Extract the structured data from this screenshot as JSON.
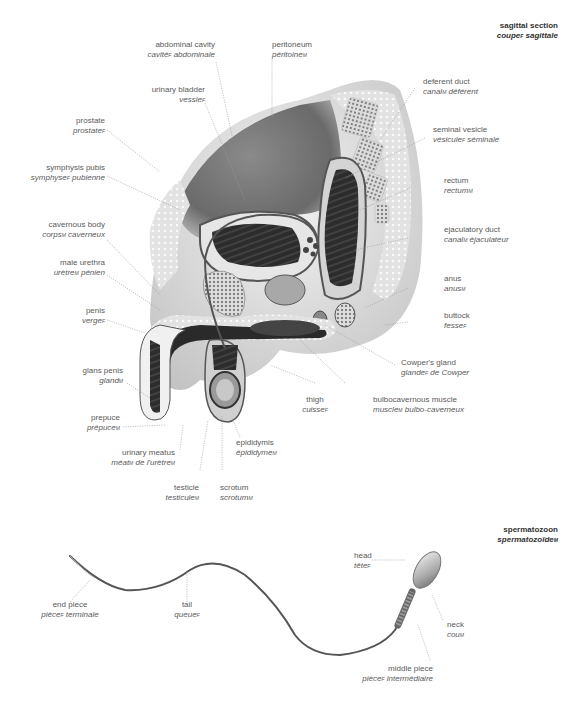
{
  "sections": {
    "sagittal": {
      "en": "sagittal section",
      "fr": "coupe",
      "fr_g": "F",
      "fr2": " sagittale"
    },
    "sperm": {
      "en": "spermatozoon",
      "fr": "spermatozoïde",
      "fr_g": "M",
      "fr2": ""
    }
  },
  "labels": {
    "abdominal_cavity": {
      "en": "abdominal cavity",
      "fr": "cavité",
      "g": "F",
      "fr2": " abdominale"
    },
    "peritoneum": {
      "en": "peritoneum",
      "fr": "péritoine",
      "g": "M",
      "fr2": ""
    },
    "urinary_bladder": {
      "en": "urinary bladder",
      "fr": "vessie",
      "g": "F",
      "fr2": ""
    },
    "prostate": {
      "en": "prostate",
      "fr": "prostate",
      "g": "F",
      "fr2": ""
    },
    "symphysis_pubis": {
      "en": "symphysis pubis",
      "fr": "symphyse",
      "g": "F",
      "fr2": " pubienne"
    },
    "cavernous_body": {
      "en": "cavernous body",
      "fr": "corps",
      "g": "M",
      "fr2": " caverneux"
    },
    "male_urethra": {
      "en": "male urethra",
      "fr": "urètre",
      "g": "M",
      "fr2": " pénien"
    },
    "penis": {
      "en": "penis",
      "fr": "verge",
      "g": "F",
      "fr2": ""
    },
    "glans_penis": {
      "en": "glans penis",
      "fr": "gland",
      "g": "M",
      "fr2": ""
    },
    "prepuce": {
      "en": "prepuce",
      "fr": "prépuce",
      "g": "M",
      "fr2": ""
    },
    "urinary_meatus": {
      "en": "urinary meatus",
      "fr": "méat",
      "g": "M",
      "fr2": " de l'urètre",
      "g2": "M"
    },
    "testicle": {
      "en": "testicle",
      "fr": "testicule",
      "g": "M",
      "fr2": ""
    },
    "scrotum": {
      "en": "scrotum",
      "fr": "scrotum",
      "g": "M",
      "fr2": ""
    },
    "epididymis": {
      "en": "epididymis",
      "fr": "épididyme",
      "g": "M",
      "fr2": ""
    },
    "thigh": {
      "en": "thigh",
      "fr": "cuisse",
      "g": "F",
      "fr2": ""
    },
    "bulbocavernous_muscle": {
      "en": "bulbocavernous muscle",
      "fr": "muscle",
      "g": "M",
      "fr2": " bulbo-caverneux"
    },
    "cowpers_gland": {
      "en": "Cowper's gland",
      "fr": "glande",
      "g": "F",
      "fr2": " de Cowper"
    },
    "buttock": {
      "en": "buttock",
      "fr": "fesse",
      "g": "F",
      "fr2": ""
    },
    "anus": {
      "en": "anus",
      "fr": "anus",
      "g": "M",
      "fr2": ""
    },
    "ejaculatory_duct": {
      "en": "ejaculatory duct",
      "fr": "canal",
      "g": "M",
      "fr2": " éjaculateur"
    },
    "rectum": {
      "en": "rectum",
      "fr": "rectum",
      "g": "M",
      "fr2": ""
    },
    "seminal_vesicle": {
      "en": "seminal vesicle",
      "fr": "vésicule",
      "g": "F",
      "fr2": " séminale"
    },
    "deferent_duct": {
      "en": "deferent duct",
      "fr": "canal",
      "g": "M",
      "fr2": " déférent"
    },
    "end_piece": {
      "en": "end piece",
      "fr": "pièce",
      "g": "F",
      "fr2": " terminale"
    },
    "tail": {
      "en": "tail",
      "fr": "queue",
      "g": "F",
      "fr2": ""
    },
    "head": {
      "en": "head",
      "fr": "tête",
      "g": "F",
      "fr2": ""
    },
    "neck": {
      "en": "neck",
      "fr": "cou",
      "g": "M",
      "fr2": ""
    },
    "middle_piece": {
      "en": "middle piece",
      "fr": "pièce",
      "g": "F",
      "fr2": " intermédiaire"
    }
  },
  "colors": {
    "text": "#5a5a5a",
    "title": "#333333",
    "leader": "#9a9a9a",
    "tissue_dark": "#3a3a3a",
    "tissue_mid": "#7a7a7a",
    "tissue_light": "#d8d8d8"
  }
}
